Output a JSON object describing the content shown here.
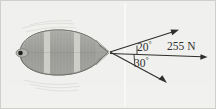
{
  "figure": {
    "background_color": "#f2f2f0",
    "border_color": "#c9c9c6",
    "ink_color": "#30302e",
    "labels": {
      "angle_upper": "20",
      "angle_upper_unit": "°",
      "angle_lower": "30",
      "angle_lower_unit": "°",
      "force": "255 N"
    },
    "vectors": [
      {
        "name": "upper-cable-force",
        "angle_deg": 20,
        "direction": "up-right",
        "origin": [
          110,
          52
        ],
        "tip": [
          178,
          30
        ]
      },
      {
        "name": "lower-cable-force",
        "angle_deg": 30,
        "direction": "down-right",
        "origin": [
          110,
          52
        ],
        "tip": [
          166,
          83
        ]
      },
      {
        "name": "resultant-force",
        "angle_deg": 0,
        "direction": "right",
        "magnitude": "255 N",
        "origin": [
          110,
          52
        ],
        "tip": [
          207,
          57
        ]
      }
    ],
    "object": {
      "name": "barge",
      "view": "top-down",
      "hull_color": "#a8a8a4",
      "deck_color": "#b9b9b5",
      "bulkhead_color": "#cfcfcb"
    }
  }
}
